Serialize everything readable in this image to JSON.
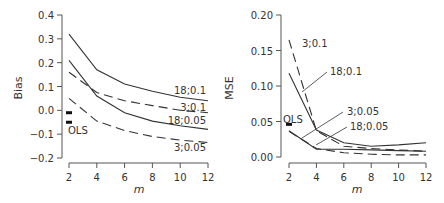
{
  "chart_data": [
    {
      "type": "line",
      "title": "",
      "xlabel": "m",
      "ylabel": "Bias",
      "x": [
        2,
        4,
        6,
        8,
        10,
        12
      ],
      "xticks": [
        "2",
        "4",
        "6",
        "8",
        "10",
        "12"
      ],
      "yticks": [
        "0.4",
        "0.3",
        "0.2",
        "0.1",
        "0.0",
        "−0.1",
        "−0.2"
      ],
      "ylim": [
        -0.2,
        0.4
      ],
      "grid": false,
      "series": [
        {
          "name": "18;0.1",
          "style": "solid",
          "values": [
            0.32,
            0.17,
            0.11,
            0.08,
            0.055,
            0.04
          ]
        },
        {
          "name": "3;0.1",
          "style": "dashed",
          "values": [
            0.16,
            0.075,
            0.04,
            0.02,
            0.0,
            -0.01
          ]
        },
        {
          "name": "18;0.05",
          "style": "solid",
          "values": [
            0.21,
            0.06,
            -0.01,
            -0.045,
            -0.065,
            -0.08
          ]
        },
        {
          "name": "3;0.05",
          "style": "dashed",
          "values": [
            0.05,
            -0.045,
            -0.085,
            -0.11,
            -0.125,
            -0.135
          ]
        }
      ],
      "ols": {
        "label": "OLS",
        "x": 2,
        "values": [
          -0.01,
          -0.05
        ]
      }
    },
    {
      "type": "line",
      "title": "",
      "xlabel": "m",
      "ylabel": "MSE",
      "x": [
        2,
        4,
        6,
        8,
        10,
        12
      ],
      "xticks": [
        "2",
        "4",
        "6",
        "8",
        "10",
        "12"
      ],
      "yticks": [
        "0.20",
        "0.15",
        "0.10",
        "0.05",
        "0.00"
      ],
      "ylim": [
        0.0,
        0.2
      ],
      "grid": false,
      "series": [
        {
          "name": "3;0.1",
          "style": "dashed",
          "values": [
            0.165,
            0.037,
            0.015,
            0.012,
            0.01,
            0.008
          ]
        },
        {
          "name": "18;0.1",
          "style": "solid",
          "values": [
            0.118,
            0.038,
            0.02,
            0.015,
            0.017,
            0.02
          ]
        },
        {
          "name": "3;0.05",
          "style": "dashed",
          "values": [
            0.036,
            0.012,
            0.006,
            0.004,
            0.003,
            0.003
          ]
        },
        {
          "name": "18;0.05",
          "style": "solid",
          "values": [
            0.037,
            0.011,
            0.011,
            0.01,
            0.009,
            0.008
          ]
        }
      ],
      "ols": {
        "label": "OLS",
        "x": 2,
        "values": [
          0.046
        ]
      }
    }
  ],
  "colors": {
    "line": "#333333",
    "axis": "#555555",
    "text": "#333333"
  }
}
